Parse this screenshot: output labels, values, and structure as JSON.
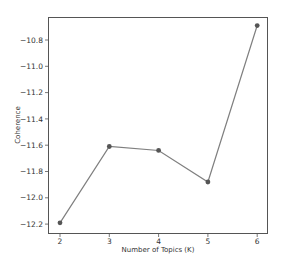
{
  "chart_data": {
    "type": "line",
    "title": "",
    "xlabel": "Number of Topics (K)",
    "ylabel": "Coherence",
    "x": [
      2,
      3,
      4,
      5,
      6
    ],
    "series": [
      {
        "name": "Coherence",
        "values": [
          -12.19,
          -11.61,
          -11.64,
          -11.88,
          -10.69
        ],
        "color": "#7f7f7f",
        "marker_color": "#555555"
      }
    ],
    "xticks": [
      "2",
      "3",
      "4",
      "5",
      "6"
    ],
    "yticks": [
      "-10.8",
      "-11.0",
      "-11.2",
      "-11.4",
      "-11.6",
      "-11.8",
      "-12.0",
      "-12.2"
    ],
    "ytick_values": [
      -10.8,
      -11.0,
      -11.2,
      -11.4,
      -11.6,
      -11.8,
      -12.0,
      -12.2
    ],
    "xlim": [
      1.8,
      6.2
    ],
    "ylim": [
      -12.26,
      -10.63
    ],
    "grid": false,
    "legend": null
  }
}
